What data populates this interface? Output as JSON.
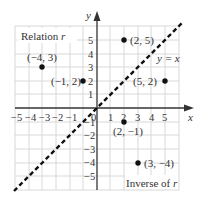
{
  "diagram": {
    "type": "coordinate-plane",
    "title_upper_left": "Relation",
    "title_upper_left_var": "r",
    "title_lower_right": "Inverse of",
    "title_lower_right_var": "r",
    "axis_x_label": "x",
    "axis_y_label": "y",
    "line_label": "y = x",
    "origin_label": "0",
    "x_ticks": [
      "−5",
      "−4",
      "−3",
      "−2",
      "−1",
      "1",
      "2",
      "3",
      "4",
      "5"
    ],
    "y_ticks": [
      "5",
      "4",
      "3",
      "2",
      "1",
      "−1",
      "−2",
      "−3",
      "−4",
      "−5"
    ],
    "relation_points": [
      {
        "label": "(−4, 3)",
        "x": -4,
        "y": 3
      },
      {
        "label": "(−1, 2)",
        "x": -1,
        "y": 2
      },
      {
        "label": "(2, 5)",
        "x": 2,
        "y": 5
      }
    ],
    "inverse_points": [
      {
        "label": "(3, −4)",
        "x": 3,
        "y": -4
      },
      {
        "label": "(2, −1)",
        "x": 2,
        "y": -1
      },
      {
        "label": "(5, 2)",
        "x": 5,
        "y": 2
      }
    ],
    "colors": {
      "grid": "#d8d8d8",
      "axis": "#333333",
      "point": "#111111",
      "dashed_line": "#111111"
    }
  }
}
